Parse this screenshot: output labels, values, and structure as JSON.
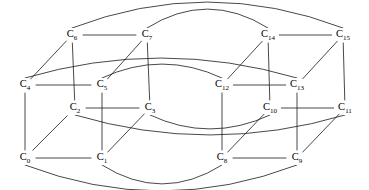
{
  "diagram": {
    "background_color": "#ffffff",
    "edge_color": "#1a1a1a",
    "label_color": "#000000",
    "node_count": 16,
    "edge_count": 32
  },
  "nodes": [
    {
      "id": "C0",
      "base": "C",
      "sub": "0",
      "x": 25,
      "y": 158
    },
    {
      "id": "C1",
      "base": "C",
      "sub": "1",
      "x": 102,
      "y": 158
    },
    {
      "id": "C2",
      "base": "C",
      "sub": "2",
      "x": 75,
      "y": 108
    },
    {
      "id": "C3",
      "base": "C",
      "sub": "3",
      "x": 150,
      "y": 108
    },
    {
      "id": "C4",
      "base": "C",
      "sub": "4",
      "x": 25,
      "y": 85
    },
    {
      "id": "C5",
      "base": "C",
      "sub": "5",
      "x": 102,
      "y": 85
    },
    {
      "id": "C6",
      "base": "C",
      "sub": "6",
      "x": 72,
      "y": 35
    },
    {
      "id": "C7",
      "base": "C",
      "sub": "7",
      "x": 147,
      "y": 35
    },
    {
      "id": "C8",
      "base": "C",
      "sub": "8",
      "x": 222,
      "y": 158
    },
    {
      "id": "C9",
      "base": "C",
      "sub": "9",
      "x": 297,
      "y": 158
    },
    {
      "id": "C10",
      "base": "C",
      "sub": "10",
      "x": 270,
      "y": 108
    },
    {
      "id": "C11",
      "base": "C",
      "sub": "11",
      "x": 345,
      "y": 108
    },
    {
      "id": "C12",
      "base": "C",
      "sub": "12",
      "x": 222,
      "y": 85
    },
    {
      "id": "C13",
      "base": "C",
      "sub": "13",
      "x": 297,
      "y": 85
    },
    {
      "id": "C14",
      "base": "C",
      "sub": "14",
      "x": 268,
      "y": 35
    },
    {
      "id": "C15",
      "base": "C",
      "sub": "15",
      "x": 343,
      "y": 35
    }
  ],
  "edges_straight": [
    {
      "from": "C6",
      "to": "C7"
    },
    {
      "from": "C14",
      "to": "C15"
    },
    {
      "from": "C4",
      "to": "C5"
    },
    {
      "from": "C12",
      "to": "C13"
    },
    {
      "from": "C2",
      "to": "C3"
    },
    {
      "from": "C10",
      "to": "C11"
    },
    {
      "from": "C0",
      "to": "C1"
    },
    {
      "from": "C8",
      "to": "C9"
    },
    {
      "from": "C6",
      "to": "C2"
    },
    {
      "from": "C7",
      "to": "C3"
    },
    {
      "from": "C14",
      "to": "C10"
    },
    {
      "from": "C15",
      "to": "C11"
    },
    {
      "from": "C4",
      "to": "C0"
    },
    {
      "from": "C5",
      "to": "C1"
    },
    {
      "from": "C12",
      "to": "C8"
    },
    {
      "from": "C13",
      "to": "C9"
    },
    {
      "from": "C6",
      "to": "C4"
    },
    {
      "from": "C7",
      "to": "C5"
    },
    {
      "from": "C14",
      "to": "C12"
    },
    {
      "from": "C15",
      "to": "C13"
    },
    {
      "from": "C2",
      "to": "C0"
    },
    {
      "from": "C3",
      "to": "C1"
    },
    {
      "from": "C10",
      "to": "C8"
    },
    {
      "from": "C11",
      "to": "C9"
    }
  ],
  "edges_arc": [
    {
      "from": "C6",
      "to": "C15",
      "bow": -26,
      "label": "top-outer-arc"
    },
    {
      "from": "C7",
      "to": "C14",
      "bow": -19,
      "label": "top-inner-arc"
    },
    {
      "from": "C4",
      "to": "C13",
      "bow": -20,
      "label": "upper-mid-outer-arc"
    },
    {
      "from": "C5",
      "to": "C12",
      "bow": -14,
      "label": "upper-mid-inner-arc"
    },
    {
      "from": "C2",
      "to": "C11",
      "bow": 20,
      "label": "lower-mid-outer-arc"
    },
    {
      "from": "C3",
      "to": "C10",
      "bow": 14,
      "label": "lower-mid-inner-arc"
    },
    {
      "from": "C0",
      "to": "C9",
      "bow": 26,
      "label": "bottom-outer-arc"
    },
    {
      "from": "C1",
      "to": "C8",
      "bow": 19,
      "label": "bottom-inner-arc"
    }
  ]
}
